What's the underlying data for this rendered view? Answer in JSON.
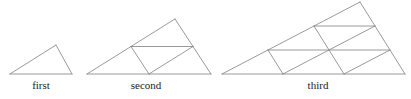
{
  "figure": {
    "name": "triangular-subdivision-sequence",
    "background_color": "#ffffff",
    "stroke_color": "#808080",
    "stroke_width": 0.8,
    "caption_color": "#1a1a1a",
    "caption_font_size": "11px",
    "width": 411,
    "height": 99
  },
  "panels": [
    {
      "id": "first",
      "caption": "first",
      "order": 1,
      "subdivisions_per_side": 1,
      "small_triangle_count": 1,
      "caption_x": 41,
      "caption_y": 79,
      "vertices": {
        "A": [
          10,
          74
        ],
        "B": [
          72,
          74
        ],
        "C": [
          56,
          45
        ]
      }
    },
    {
      "id": "second",
      "caption": "second",
      "order": 2,
      "subdivisions_per_side": 2,
      "small_triangle_count": 4,
      "caption_x": 146,
      "caption_y": 79,
      "vertices": {
        "A": [
          87,
          74
        ],
        "B": [
          211,
          74
        ],
        "C": [
          175,
          19
        ]
      }
    },
    {
      "id": "third",
      "caption": "third",
      "order": 3,
      "subdivisions_per_side": 3,
      "small_triangle_count": 9,
      "caption_x": 318,
      "caption_y": 79,
      "vertices": {
        "A": [
          222,
          74
        ],
        "B": [
          405,
          74
        ],
        "C": [
          360,
          2
        ]
      }
    }
  ]
}
